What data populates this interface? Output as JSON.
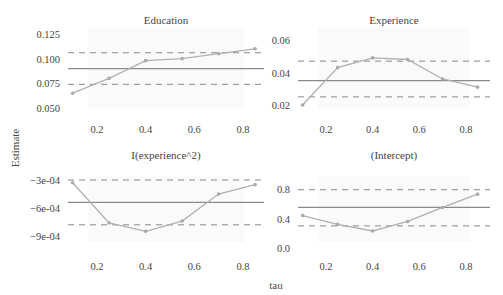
{
  "chart_data": {
    "type": "line",
    "xlabel": "tau",
    "ylabel": "Estimate",
    "x_ticks": [
      "0.2",
      "0.4",
      "0.6",
      "0.8"
    ],
    "x": [
      0.1,
      0.25,
      0.4,
      0.55,
      0.7,
      0.85
    ],
    "panels": [
      {
        "title": "Education",
        "y_ticks": [
          "0.050",
          "0.075",
          "0.100",
          "0.125"
        ],
        "y_tick_values": [
          0.05,
          0.075,
          0.1,
          0.125
        ],
        "ylim": [
          0.045,
          0.13
        ],
        "quantile_estimates": [
          0.065,
          0.08,
          0.098,
          0.1,
          0.105,
          0.11
        ],
        "ols_estimate": 0.09,
        "ols_ci": [
          0.074,
          0.106
        ]
      },
      {
        "title": "Experience",
        "y_ticks": [
          "0.02",
          "0.04",
          "0.06"
        ],
        "y_tick_values": [
          0.02,
          0.04,
          0.06
        ],
        "ylim": [
          0.015,
          0.065
        ],
        "quantile_estimates": [
          0.02,
          0.043,
          0.049,
          0.048,
          0.036,
          0.031
        ],
        "ols_estimate": 0.035,
        "ols_ci": [
          0.025,
          0.047
        ]
      },
      {
        "title": "I(experience^2)",
        "y_ticks": [
          "-9e-04",
          "-6e-04",
          "-3e-04"
        ],
        "y_tick_values": [
          -0.0009,
          -0.0006,
          -0.0003
        ],
        "ylim": [
          -0.00098,
          -0.00025
        ],
        "quantile_estimates": [
          -0.00033,
          -0.00076,
          -0.00085,
          -0.00074,
          -0.00045,
          -0.00035
        ],
        "ols_estimate": -0.00054,
        "ols_ci": [
          -0.00078,
          -0.0003
        ]
      },
      {
        "title": "(Intercept)",
        "y_ticks": [
          "0.0",
          "0.4",
          "0.8"
        ],
        "y_tick_values": [
          0.0,
          0.4,
          0.8
        ],
        "ylim": [
          -0.05,
          0.9
        ],
        "quantile_estimates": [
          0.44,
          0.32,
          0.23,
          0.36,
          0.55,
          0.73
        ],
        "ols_estimate": 0.55,
        "ols_ci": [
          0.3,
          0.79
        ]
      }
    ],
    "legend": "none",
    "grid": false
  }
}
